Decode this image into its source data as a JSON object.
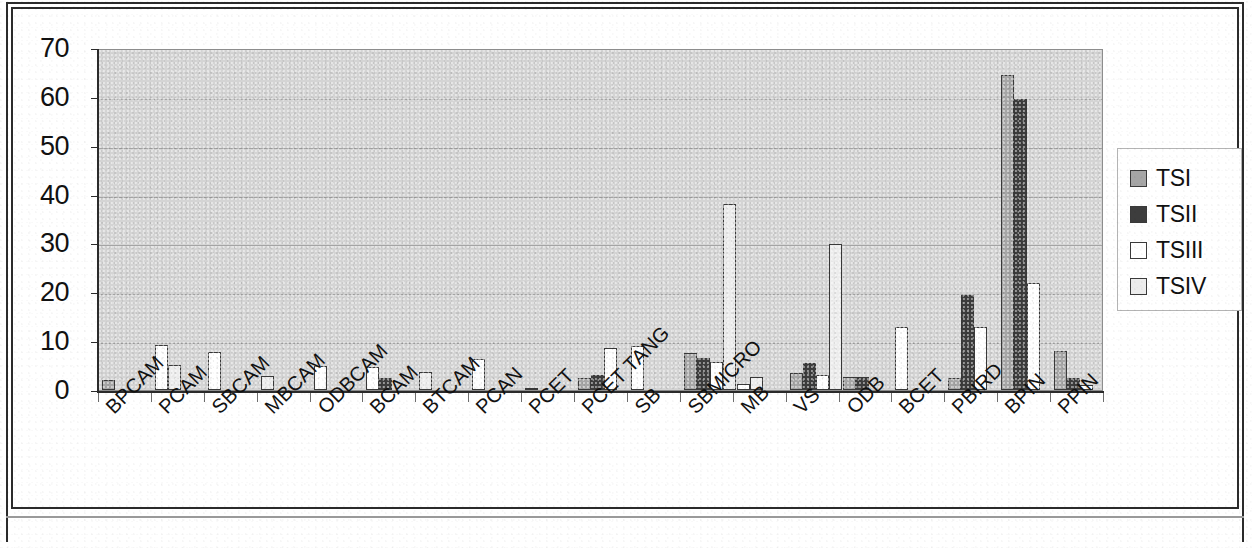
{
  "chart_data": {
    "type": "bar",
    "title": "",
    "subtitle": "",
    "xlabel": "",
    "ylabel": "",
    "ylim": [
      0,
      70
    ],
    "y_ticks": [
      0,
      10,
      20,
      30,
      40,
      50,
      60,
      70
    ],
    "grid": true,
    "legend_position": "right",
    "categories": [
      "BPCAM",
      "PCAM",
      "SBCAM",
      "MBCAM",
      "ODBCAM",
      "BCAM",
      "BTCAM",
      "PCAN",
      "PCET",
      "PCET TANG",
      "SB",
      "SBMICRO",
      "MB",
      "VS",
      "ODB",
      "BCET",
      "PBIRD",
      "BPIN",
      "PPIN"
    ],
    "series": [
      {
        "name": "TSI",
        "color": "#a6a6a6",
        "values": [
          2,
          0,
          0,
          0,
          0,
          0,
          0,
          0,
          2.5,
          0,
          0,
          0,
          3.5,
          0,
          0,
          2.5,
          64.5,
          8,
          0
        ]
      },
      {
        "name": "TSII",
        "color": "#3d3d3d",
        "values": [
          0,
          0,
          0,
          0,
          0,
          2.5,
          0,
          0.5,
          3,
          0,
          0,
          0,
          5.5,
          2.7,
          0,
          19.5,
          59.5,
          2.5,
          0
        ]
      },
      {
        "name": "TSIII",
        "color": "#ffffff",
        "values": [
          0,
          9.3,
          7.7,
          0,
          5,
          0,
          3.6,
          0,
          8.5,
          0,
          9,
          1.3,
          3,
          0,
          0,
          13,
          22,
          1,
          1
        ]
      },
      {
        "name": "TSIV",
        "color": "#ececec",
        "values": [
          0,
          5.2,
          0,
          2.8,
          0,
          4.7,
          0,
          0,
          0,
          0,
          7.6,
          2.7,
          29.8,
          2.7,
          12.8,
          0,
          0,
          0,
          0
        ]
      }
    ],
    "group_bars": [
      {
        "category": "BPCAM",
        "bars": [
          {
            "series": "TSI",
            "value": 2
          }
        ]
      },
      {
        "category": "PCAM",
        "bars": [
          {
            "series": "TSIII",
            "value": 9.3
          },
          {
            "series": "TSIV",
            "value": 5.2
          }
        ]
      },
      {
        "category": "SBCAM",
        "bars": [
          {
            "series": "TSIII",
            "value": 7.7
          }
        ]
      },
      {
        "category": "MBCAM",
        "bars": [
          {
            "series": "TSIV",
            "value": 2.8
          }
        ]
      },
      {
        "category": "ODBCAM",
        "bars": [
          {
            "series": "TSIII",
            "value": 5.0
          }
        ]
      },
      {
        "category": "BCAM",
        "bars": [
          {
            "series": "TSIII",
            "value": 4.8
          },
          {
            "series": "TSII",
            "value": 2.5
          }
        ]
      },
      {
        "category": "BTCAM",
        "bars": [
          {
            "series": "TSIV",
            "value": 3.6
          }
        ]
      },
      {
        "category": "PCAN",
        "bars": [
          {
            "series": "TSIII",
            "value": 6.4
          }
        ]
      },
      {
        "category": "PCET",
        "bars": [
          {
            "series": "TSII",
            "value": 0.5
          }
        ]
      },
      {
        "category": "PCET TANG",
        "bars": [
          {
            "series": "TSI",
            "value": 2.5
          },
          {
            "series": "TSII",
            "value": 3.0
          },
          {
            "series": "TSIII",
            "value": 8.5
          }
        ]
      },
      {
        "category": "SB",
        "bars": [
          {
            "series": "TSIII",
            "value": 9.0
          }
        ]
      },
      {
        "category": "SBMICRO",
        "bars": [
          {
            "series": "TSI",
            "value": 7.6
          },
          {
            "series": "TSII",
            "value": 6.6
          },
          {
            "series": "TSIII",
            "value": 5.7
          },
          {
            "series": "TSIV",
            "value": 38.0
          }
        ]
      },
      {
        "category": "MB",
        "bars": [
          {
            "series": "TSIII",
            "value": 1.3
          },
          {
            "series": "TSIV",
            "value": 2.7
          }
        ]
      },
      {
        "category": "VS",
        "bars": [
          {
            "series": "TSI",
            "value": 3.5
          },
          {
            "series": "TSII",
            "value": 5.5
          },
          {
            "series": "TSIII",
            "value": 3.0
          },
          {
            "series": "TSIV",
            "value": 29.8
          }
        ]
      },
      {
        "category": "ODB",
        "bars": [
          {
            "series": "TSI",
            "value": 2.7
          },
          {
            "series": "TSII",
            "value": 2.7
          }
        ]
      },
      {
        "category": "BCET",
        "bars": [
          {
            "series": "TSIII",
            "value": 12.8
          }
        ]
      },
      {
        "category": "PBIRD",
        "bars": [
          {
            "series": "TSI",
            "value": 2.5
          },
          {
            "series": "TSII",
            "value": 19.5
          },
          {
            "series": "TSIII",
            "value": 13.0
          }
        ]
      },
      {
        "category": "BPIN",
        "bars": [
          {
            "series": "TSI",
            "value": 64.5
          },
          {
            "series": "TSII",
            "value": 59.5
          },
          {
            "series": "TSIII",
            "value": 22.0
          }
        ]
      },
      {
        "category": "PPIN",
        "bars": [
          {
            "series": "TSI",
            "value": 8.0
          },
          {
            "series": "TSII",
            "value": 2.5
          },
          {
            "series": "TSIII",
            "value": 1.0
          }
        ]
      }
    ]
  },
  "legend": {
    "entries": [
      {
        "label": "TSI",
        "swatch": "ts1"
      },
      {
        "label": "TSII",
        "swatch": "ts2"
      },
      {
        "label": "TSIII",
        "swatch": "ts3"
      },
      {
        "label": "TSIV",
        "swatch": "ts4"
      }
    ]
  },
  "axis": {
    "y_tick_labels": [
      "70",
      "60",
      "50",
      "40",
      "30",
      "20",
      "10",
      "0"
    ]
  },
  "colors": {
    "ts1": "#a6a6a6",
    "ts2": "#3d3d3d",
    "ts3": "#ffffff",
    "ts4": "#ececec",
    "plot_background": "#d4d4d4",
    "axis": "#2b2b2b",
    "gridline": "#9b9b9b"
  }
}
